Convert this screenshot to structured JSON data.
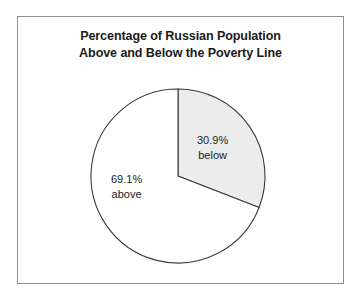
{
  "chart_data": {
    "type": "pie",
    "title": "Percentage of Russian Population Above and Below the Poverty Line",
    "title_lines": [
      "Percentage of Russian Population",
      "Above and Below the Poverty Line"
    ],
    "categories": [
      "below",
      "above"
    ],
    "values": [
      30.9,
      69.1
    ],
    "units": "percent",
    "start_angle_deg": 0,
    "direction": "clockwise",
    "legend": "none",
    "grid": false,
    "slices": [
      {
        "name": "below",
        "value": 30.9,
        "value_label": "30.9%",
        "name_label": "below",
        "fill": "#ececec",
        "stroke": "#3c3c3c"
      },
      {
        "name": "above",
        "value": 69.1,
        "value_label": "69.1%",
        "name_label": "above",
        "fill": "#ffffff",
        "stroke": "#3c3c3c"
      }
    ]
  },
  "figure": {
    "background": "#ffffff",
    "frame_color": "#8d8f92",
    "text_color": "#1b1b1b"
  }
}
